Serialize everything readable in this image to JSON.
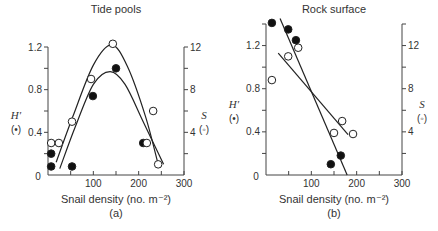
{
  "chart_data": [
    {
      "type": "scatter",
      "panel_label": "(a)",
      "title": "Tide pools",
      "xlabel": "Snail density (no. m⁻²)",
      "ylabel_left": "H′",
      "ylabel_left_marker": "(•)",
      "ylabel_right": "S",
      "ylabel_right_marker": "(◦)",
      "xlim": [
        0,
        300
      ],
      "ylim_left": [
        0,
        1.2
      ],
      "ylim_right": [
        0,
        12
      ],
      "xticks": [
        0,
        50,
        100,
        150,
        200,
        250,
        300
      ],
      "xtick_labels": [
        "",
        "",
        "100",
        "",
        "200",
        "",
        "300"
      ],
      "x_zero_label": "0",
      "yticks_left": [
        0,
        0.2,
        0.4,
        0.6,
        0.8,
        1.0,
        1.2
      ],
      "ytick_labels_left": [
        "0",
        "",
        "0.4",
        "",
        "0.8",
        "",
        "1.2"
      ],
      "yticks_right": [
        0,
        2,
        4,
        6,
        8,
        10,
        12
      ],
      "ytick_labels_right": [
        "",
        "",
        "4",
        "",
        "8",
        "",
        "12"
      ],
      "grid": false,
      "series": [
        {
          "name": "H′ (filled circles)",
          "axis": "left",
          "marker": "filled-circle",
          "points": [
            [
              7,
              0.2
            ],
            [
              7,
              0.08
            ],
            [
              53,
              0.08
            ],
            [
              99,
              0.74
            ],
            [
              150,
              1.0
            ],
            [
              210,
              0.3
            ]
          ],
          "fit": {
            "kind": "curve",
            "points": [
              [
                26,
                0.06
              ],
              [
                60,
                0.45
              ],
              [
                100,
                0.85
              ],
              [
                137,
                0.97
              ],
              [
                170,
                0.85
              ],
              [
                210,
                0.5
              ],
              [
                255,
                0.1
              ]
            ]
          }
        },
        {
          "name": "S (open circles)",
          "axis": "right",
          "marker": "open-circle",
          "points": [
            [
              7,
              3
            ],
            [
              24,
              3
            ],
            [
              53,
              5
            ],
            [
              95,
              9
            ],
            [
              143,
              12.3
            ],
            [
              218,
              3
            ],
            [
              232,
              6
            ],
            [
              243,
              1
            ]
          ],
          "fit": {
            "kind": "curve",
            "points": [
              [
                18,
                1.2
              ],
              [
                55,
                5.5
              ],
              [
                100,
                10.3
              ],
              [
                140,
                12.2
              ],
              [
                175,
                10.2
              ],
              [
                215,
                5.5
              ],
              [
                243,
                1
              ]
            ]
          }
        }
      ]
    },
    {
      "type": "scatter",
      "panel_label": "(b)",
      "title": "Rock surface",
      "xlabel": "Snail density (no. m⁻²)",
      "ylabel_left": "H′",
      "ylabel_left_marker": "(•)",
      "ylabel_right": "S",
      "ylabel_right_marker": "(◦)",
      "xlim": [
        0,
        300
      ],
      "ylim_left": [
        0,
        1.4
      ],
      "ylim_right": [
        0,
        14
      ],
      "xticks": [
        0,
        50,
        100,
        150,
        200,
        250,
        300
      ],
      "xtick_labels": [
        "",
        "",
        "100",
        "",
        "200",
        "",
        "300"
      ],
      "x_zero_label": "0",
      "yticks_left": [
        0,
        0.2,
        0.4,
        0.6,
        0.8,
        1.0,
        1.2,
        1.4
      ],
      "ytick_labels_left": [
        "0",
        "",
        "0.4",
        "",
        "0.8",
        "",
        "1.2",
        ""
      ],
      "yticks_right": [
        0,
        2,
        4,
        6,
        8,
        10,
        12,
        14
      ],
      "ytick_labels_right": [
        "",
        "",
        "4",
        "",
        "8",
        "",
        "12",
        ""
      ],
      "grid": false,
      "series": [
        {
          "name": "H′ (filled circles)",
          "axis": "left",
          "marker": "filled-circle",
          "points": [
            [
              13,
              1.41
            ],
            [
              49,
              1.35
            ],
            [
              66,
              1.25
            ],
            [
              143,
              0.1
            ],
            [
              165,
              0.18
            ]
          ],
          "fit": {
            "kind": "line",
            "points": [
              [
                31,
                1.45
              ],
              [
                179,
                0.0
              ]
            ]
          }
        },
        {
          "name": "S (open circles)",
          "axis": "right",
          "marker": "open-circle",
          "points": [
            [
              13,
              8.8
            ],
            [
              49,
              11
            ],
            [
              71,
              11.8
            ],
            [
              150,
              3.9
            ],
            [
              168,
              5
            ],
            [
              192,
              3.8
            ]
          ],
          "fit": {
            "kind": "line",
            "points": [
              [
                27,
                11.3
              ],
              [
                181,
                3.75
              ]
            ]
          }
        }
      ]
    }
  ]
}
